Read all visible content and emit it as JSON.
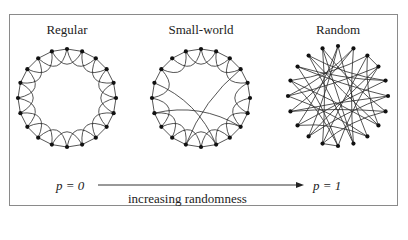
{
  "panels": [
    {
      "title": "Regular",
      "type": "regular",
      "cx": 67,
      "cy": 98,
      "r": 49
    },
    {
      "title": "Small-world",
      "type": "small-world",
      "cx": 201,
      "cy": 98,
      "r": 49
    },
    {
      "title": "Random",
      "type": "random",
      "cx": 338,
      "cy": 96,
      "r": 50
    }
  ],
  "nodes_per_ring": 20,
  "axis": {
    "left_label": "p = 0",
    "right_label": "p = 1",
    "caption": "increasing randomness"
  },
  "colors": {
    "line": "#2a2a2a",
    "node": "#111111",
    "frame": "#8a8a8a"
  }
}
